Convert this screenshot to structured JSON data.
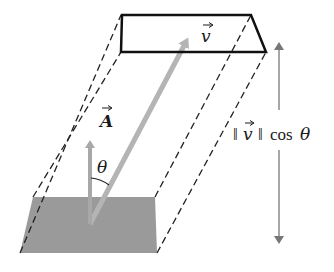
{
  "diagram": {
    "colors": {
      "outline": "#111111",
      "base_fill": "#9a9a9a",
      "vector_A": "#a8a8a8",
      "vector_v": "#b4b4b4",
      "height_arrow": "#777777"
    },
    "labels": {
      "vector_v": "v",
      "vector_A": "A",
      "angle": "θ",
      "height_norm": "‖v‖",
      "height_cos": "cos θ",
      "height_full": "‖v‖ cos θ"
    },
    "shapes": {
      "top_face": {
        "style": "solid-outline",
        "points": [
          [
            122,
            15
          ],
          [
            251,
            15
          ],
          [
            266,
            52
          ],
          [
            121,
            52
          ]
        ]
      },
      "base_face": {
        "style": "gray-fill",
        "points": [
          [
            33,
            197
          ],
          [
            155,
            197
          ],
          [
            157,
            253
          ],
          [
            20,
            253
          ]
        ]
      },
      "dashed_edges": 4
    },
    "arrows": [
      {
        "name": "vector-A",
        "from": [
          90,
          224
        ],
        "to": [
          90,
          136
        ]
      },
      {
        "name": "vector-v",
        "from": [
          90,
          224
        ],
        "to": [
          190,
          34
        ]
      },
      {
        "name": "height-up",
        "from": [
          279,
          110
        ],
        "to": [
          279,
          38
        ]
      },
      {
        "name": "height-down",
        "from": [
          279,
          150
        ],
        "to": [
          279,
          248
        ]
      }
    ]
  }
}
